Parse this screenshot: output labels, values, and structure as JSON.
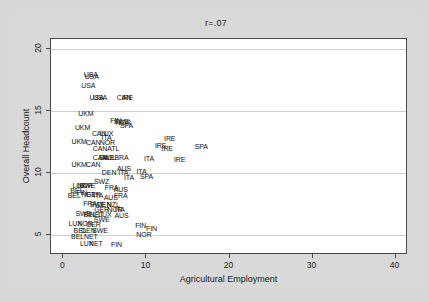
{
  "chart_data": {
    "type": "scatter",
    "title": "r=.07",
    "xlabel": "Agricultural Employment",
    "ylabel": "Overall Headcount",
    "xlim": [
      -1.5,
      41.5
    ],
    "ylim": [
      3.4,
      20.8
    ],
    "xticks": [
      "0",
      "10",
      "20",
      "30",
      "40"
    ],
    "xtickvalues": [
      0,
      10,
      20,
      30,
      40
    ],
    "yticks": [
      "5",
      "10",
      "15",
      "20"
    ],
    "ytickvalues": [
      5,
      10,
      15,
      20
    ],
    "grid": "horizontal",
    "legend": "none",
    "marker_style": "country-code-text-labels",
    "points": [
      {
        "label": "USA",
        "x": 3.3,
        "y": 18.0
      },
      {
        "label": "USA",
        "x": 3.4,
        "y": 17.8
      },
      {
        "label": "USA",
        "x": 3.0,
        "y": 17.1
      },
      {
        "label": "USA",
        "x": 4.0,
        "y": 16.1
      },
      {
        "label": "USA",
        "x": 4.4,
        "y": 16.1
      },
      {
        "label": "CAN",
        "x": 7.3,
        "y": 16.1
      },
      {
        "label": "IRE",
        "x": 7.7,
        "y": 16.1
      },
      {
        "label": "UKM",
        "x": 2.7,
        "y": 14.8
      },
      {
        "label": "FIN",
        "x": 6.3,
        "y": 14.3
      },
      {
        "label": "SWE",
        "x": 7.0,
        "y": 14.2
      },
      {
        "label": "NOR",
        "x": 7.2,
        "y": 14.1
      },
      {
        "label": "SPA",
        "x": 7.6,
        "y": 13.9
      },
      {
        "label": "UKM",
        "x": 2.3,
        "y": 13.7
      },
      {
        "label": "CAN",
        "x": 4.3,
        "y": 13.2
      },
      {
        "label": "LUX",
        "x": 5.2,
        "y": 13.2
      },
      {
        "label": "ITA",
        "x": 5.2,
        "y": 12.9
      },
      {
        "label": "UKM",
        "x": 1.9,
        "y": 12.6
      },
      {
        "label": "CAN",
        "x": 3.6,
        "y": 12.5
      },
      {
        "label": "NOR",
        "x": 5.3,
        "y": 12.5
      },
      {
        "label": "IRE",
        "x": 12.8,
        "y": 12.8
      },
      {
        "label": "IRE",
        "x": 11.7,
        "y": 12.3
      },
      {
        "label": "IRE",
        "x": 12.5,
        "y": 12.0
      },
      {
        "label": "SPA",
        "x": 16.6,
        "y": 12.2
      },
      {
        "label": "CAN",
        "x": 4.4,
        "y": 12.0
      },
      {
        "label": "ATL",
        "x": 6.0,
        "y": 12.0
      },
      {
        "label": "CAN",
        "x": 4.4,
        "y": 11.3
      },
      {
        "label": "AUL",
        "x": 5.5,
        "y": 11.3
      },
      {
        "label": "SWE",
        "x": 5.2,
        "y": 11.3
      },
      {
        "label": "BRA",
        "x": 7.0,
        "y": 11.3
      },
      {
        "label": "ITA",
        "x": 10.3,
        "y": 11.2
      },
      {
        "label": "IRE",
        "x": 14.0,
        "y": 11.1
      },
      {
        "label": "UKM",
        "x": 1.9,
        "y": 10.7
      },
      {
        "label": "CAN",
        "x": 3.6,
        "y": 10.7
      },
      {
        "label": "DEN",
        "x": 5.5,
        "y": 10.1
      },
      {
        "label": "AUS",
        "x": 7.3,
        "y": 10.4
      },
      {
        "label": "ITA",
        "x": 7.2,
        "y": 10.1
      },
      {
        "label": "ITA",
        "x": 9.4,
        "y": 10.2
      },
      {
        "label": "SPA",
        "x": 10.0,
        "y": 9.8
      },
      {
        "label": "ITA",
        "x": 7.9,
        "y": 9.7
      },
      {
        "label": "SWZ",
        "x": 4.6,
        "y": 9.4
      },
      {
        "label": "LUX",
        "x": 1.9,
        "y": 9.0
      },
      {
        "label": "NOR",
        "x": 2.6,
        "y": 9.0
      },
      {
        "label": "SWE",
        "x": 2.9,
        "y": 9.0
      },
      {
        "label": "FRA",
        "x": 5.8,
        "y": 8.9
      },
      {
        "label": "AUS",
        "x": 6.9,
        "y": 8.7
      },
      {
        "label": "BEL",
        "x": 1.6,
        "y": 8.6
      },
      {
        "label": "FIN",
        "x": 2.2,
        "y": 8.5
      },
      {
        "label": "BEL",
        "x": 1.3,
        "y": 8.2
      },
      {
        "label": "NET",
        "x": 3.0,
        "y": 8.3
      },
      {
        "label": "GER",
        "x": 3.6,
        "y": 8.3
      },
      {
        "label": "ITA",
        "x": 4.2,
        "y": 8.2
      },
      {
        "label": "AUS",
        "x": 5.7,
        "y": 8.1
      },
      {
        "label": "FRA",
        "x": 6.9,
        "y": 8.2
      },
      {
        "label": "FRA",
        "x": 3.2,
        "y": 7.6
      },
      {
        "label": "SWE",
        "x": 4.1,
        "y": 7.5
      },
      {
        "label": "DEN",
        "x": 4.9,
        "y": 7.5
      },
      {
        "label": "NZL",
        "x": 6.0,
        "y": 7.5
      },
      {
        "label": "GER",
        "x": 4.6,
        "y": 7.1
      },
      {
        "label": "NOR",
        "x": 6.2,
        "y": 7.1
      },
      {
        "label": "ITA",
        "x": 6.8,
        "y": 7.1
      },
      {
        "label": "SWE",
        "x": 2.4,
        "y": 6.8
      },
      {
        "label": "BEL",
        "x": 3.2,
        "y": 6.7
      },
      {
        "label": "NET",
        "x": 4.0,
        "y": 6.7
      },
      {
        "label": "LUX",
        "x": 5.0,
        "y": 6.7
      },
      {
        "label": "AUS",
        "x": 7.0,
        "y": 6.6
      },
      {
        "label": "SWE",
        "x": 4.6,
        "y": 6.3
      },
      {
        "label": "LUX",
        "x": 1.4,
        "y": 6.0
      },
      {
        "label": "NOR",
        "x": 2.6,
        "y": 6.0
      },
      {
        "label": "GER",
        "x": 3.6,
        "y": 5.9
      },
      {
        "label": "FIN",
        "x": 9.3,
        "y": 5.8
      },
      {
        "label": "FIN",
        "x": 10.6,
        "y": 5.6
      },
      {
        "label": "BEL",
        "x": 2.0,
        "y": 5.4
      },
      {
        "label": "DEN",
        "x": 3.0,
        "y": 5.4
      },
      {
        "label": "SWE",
        "x": 4.4,
        "y": 5.4
      },
      {
        "label": "NOR",
        "x": 9.7,
        "y": 5.1
      },
      {
        "label": "BEL",
        "x": 1.7,
        "y": 4.9
      },
      {
        "label": "NET",
        "x": 3.3,
        "y": 4.9
      },
      {
        "label": "LUX",
        "x": 2.8,
        "y": 4.4
      },
      {
        "label": "NET",
        "x": 3.9,
        "y": 4.4
      },
      {
        "label": "FIN",
        "x": 6.4,
        "y": 4.3
      }
    ]
  }
}
